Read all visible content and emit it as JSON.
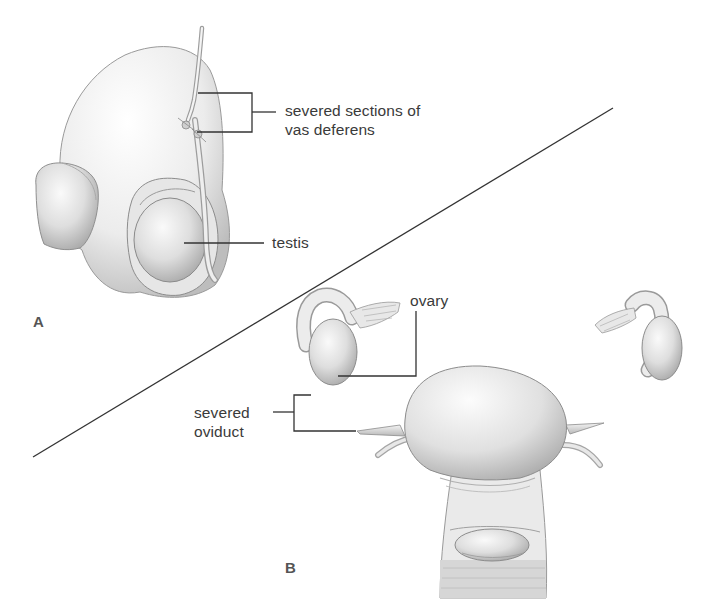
{
  "figure": {
    "panels": [
      {
        "id": "A",
        "letter": "A",
        "subject": "male vasectomy",
        "labels": {
          "vas_line1": "severed sections of",
          "vas_line2": "vas deferens",
          "testis": "testis"
        }
      },
      {
        "id": "B",
        "letter": "B",
        "subject": "female tubal ligation",
        "labels": {
          "ovary": "ovary",
          "oviduct_line1": "severed",
          "oviduct_line2": "oviduct"
        }
      }
    ],
    "colors": {
      "background": "#ffffff",
      "label_text": "#3a3a3a",
      "leader_line": "#333333",
      "divider_line": "#333333",
      "tissue_light": "#f2f2f2",
      "tissue_mid": "#d4d4d4",
      "tissue_dark": "#a8a8a8"
    }
  }
}
